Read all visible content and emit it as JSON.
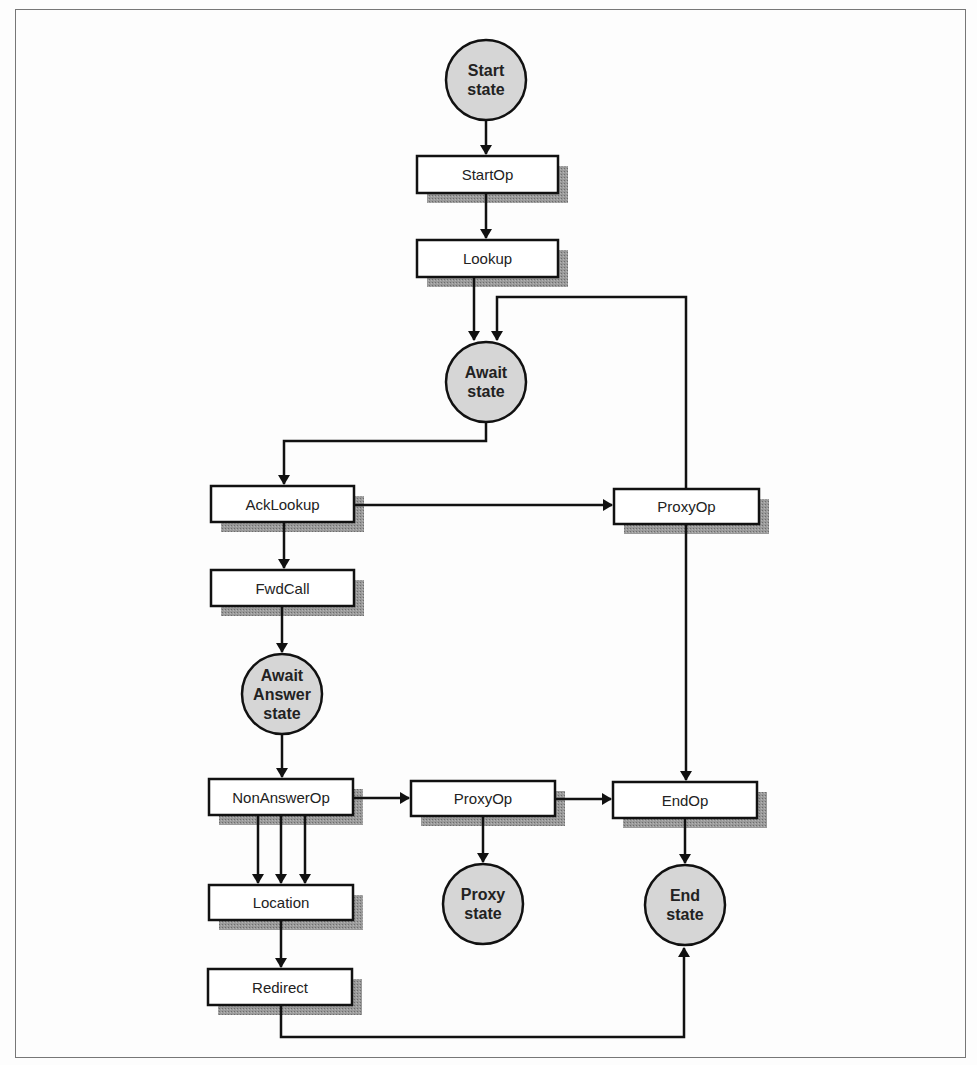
{
  "diagram": {
    "colors": {
      "line": "#111111",
      "box_fill": "#ffffff",
      "circle_fill": "#d6d6d6",
      "shadow": "#8a8a8a",
      "frame": "#777777"
    },
    "states": [
      {
        "id": "start",
        "label": "Start\nstate",
        "cx": 486,
        "cy": 80
      },
      {
        "id": "await",
        "label": "Await\nstate",
        "cx": 486,
        "cy": 382
      },
      {
        "id": "await-answer",
        "label": "Await\nAnswer\nstate",
        "cx": 282,
        "cy": 694
      },
      {
        "id": "proxy",
        "label": "Proxy\nstate",
        "cx": 483,
        "cy": 904
      },
      {
        "id": "end",
        "label": "End\nstate",
        "cx": 685,
        "cy": 905
      }
    ],
    "operations": [
      {
        "id": "startop",
        "label": "StartOp",
        "x": 417,
        "y": 156,
        "w": 141,
        "h": 37
      },
      {
        "id": "lookup",
        "label": "Lookup",
        "x": 417,
        "y": 240,
        "w": 141,
        "h": 37
      },
      {
        "id": "acklookup",
        "label": "AckLookup",
        "x": 211,
        "y": 486,
        "w": 143,
        "h": 36
      },
      {
        "id": "proxyop-1",
        "label": "ProxyOp",
        "x": 614,
        "y": 489,
        "w": 145,
        "h": 35
      },
      {
        "id": "fwdcall",
        "label": "FwdCall",
        "x": 211,
        "y": 570,
        "w": 143,
        "h": 36
      },
      {
        "id": "nonanswerop",
        "label": "NonAnswerOp",
        "x": 209,
        "y": 779,
        "w": 144,
        "h": 36
      },
      {
        "id": "proxyop-2",
        "label": "ProxyOp",
        "x": 411,
        "y": 781,
        "w": 144,
        "h": 35
      },
      {
        "id": "endop",
        "label": "EndOp",
        "x": 613,
        "y": 782,
        "w": 144,
        "h": 36
      },
      {
        "id": "location",
        "label": "Location",
        "x": 209,
        "y": 885,
        "w": 144,
        "h": 35
      },
      {
        "id": "redirect",
        "label": "Redirect",
        "x": 208,
        "y": 969,
        "w": 144,
        "h": 36
      }
    ],
    "transitions": [
      {
        "from": "Start state",
        "to": "StartOp"
      },
      {
        "from": "StartOp",
        "to": "Lookup"
      },
      {
        "from": "Lookup",
        "to": "Await state"
      },
      {
        "from": "ProxyOp",
        "to": "Await state"
      },
      {
        "from": "Await state",
        "to": "AckLookup"
      },
      {
        "from": "AckLookup",
        "to": "ProxyOp"
      },
      {
        "from": "AckLookup",
        "to": "FwdCall"
      },
      {
        "from": "FwdCall",
        "to": "Await Answer state"
      },
      {
        "from": "Await Answer state",
        "to": "NonAnswerOp"
      },
      {
        "from": "NonAnswerOp",
        "to": "ProxyOp"
      },
      {
        "from": "ProxyOp",
        "to": "EndOp"
      },
      {
        "from": "ProxyOp",
        "to": "Proxy state"
      },
      {
        "from": "ProxyOp",
        "to": "EndOp (via right column)"
      },
      {
        "from": "NonAnswerOp",
        "to": "Location (x3)"
      },
      {
        "from": "Location",
        "to": "Redirect"
      },
      {
        "from": "EndOp",
        "to": "End state"
      },
      {
        "from": "Redirect",
        "to": "End state"
      }
    ]
  }
}
